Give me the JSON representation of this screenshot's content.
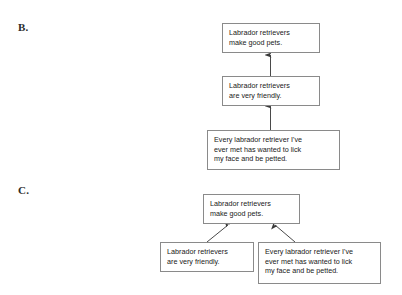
{
  "page": {
    "background_color": "#ffffff",
    "box_border_color": "#8a8a8a",
    "arrow_color": "#3a3a3a",
    "text_color": "#202020"
  },
  "statements": {
    "conclusion": "Labrador retrievers\nmake good pets.",
    "friendly": "Labrador retrievers\nare very friendly.",
    "evidence": "Every labrador retriever I've\never met has wanted to lick\nmy face and be petted."
  },
  "diagrams": [
    {
      "id": "b",
      "label": "B.",
      "structure": "serial",
      "nodes": [
        {
          "id": "b-conclusion",
          "text_key": "conclusion",
          "role": "conclusion"
        },
        {
          "id": "b-friendly",
          "text_key": "friendly",
          "role": "intermediate"
        },
        {
          "id": "b-evidence",
          "text_key": "evidence",
          "role": "premise"
        }
      ],
      "edges": [
        {
          "from": "b-evidence",
          "to": "b-friendly"
        },
        {
          "from": "b-friendly",
          "to": "b-conclusion"
        }
      ]
    },
    {
      "id": "c",
      "label": "C.",
      "structure": "convergent",
      "nodes": [
        {
          "id": "c-conclusion",
          "text_key": "conclusion",
          "role": "conclusion"
        },
        {
          "id": "c-friendly",
          "text_key": "friendly",
          "role": "premise"
        },
        {
          "id": "c-evidence",
          "text_key": "evidence",
          "role": "premise"
        }
      ],
      "edges": [
        {
          "from": "c-friendly",
          "to": "c-conclusion"
        },
        {
          "from": "c-evidence",
          "to": "c-conclusion"
        }
      ]
    }
  ]
}
